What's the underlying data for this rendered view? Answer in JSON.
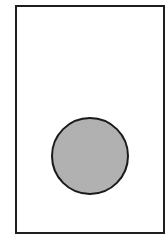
{
  "diagram": {
    "frame": {
      "shape": "rectangle",
      "stroke": "#1e1e1e",
      "fill": "#ffffff"
    },
    "disc": {
      "shape": "circle",
      "stroke": "#1a1a1a",
      "fill": "#d4d4d4",
      "pattern": "stipple"
    },
    "labels": []
  }
}
